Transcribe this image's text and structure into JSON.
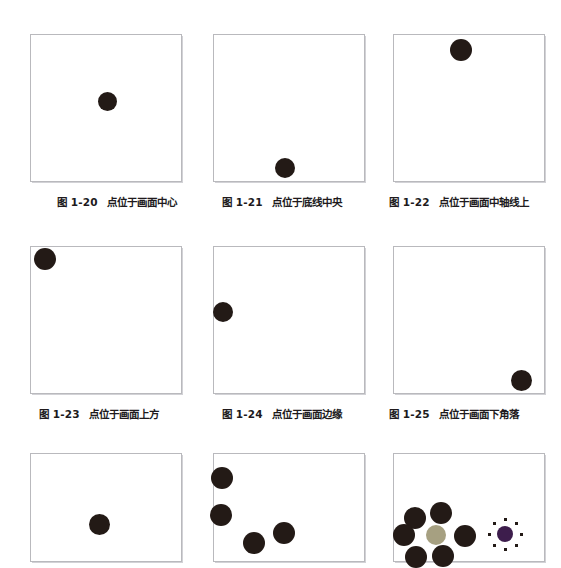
{
  "page": {
    "background_color": "#ffffff",
    "frame_border_color": "#b9b9bd",
    "dot_color": "#231a16",
    "accent_tan_color": "#a6a081",
    "accent_purple_color": "#3d1d4c"
  },
  "figures": [
    {
      "id": "fig-1-20",
      "label": "图 1-20",
      "caption": "点位于画面中心",
      "frame": {
        "x": 30,
        "y": 34,
        "w": 152,
        "h": 148
      },
      "dots": [
        {
          "cx": 107,
          "cy": 101,
          "r": 9.5,
          "color": "#231a16",
          "name": "dot-center"
        }
      ]
    },
    {
      "id": "fig-1-21",
      "label": "图 1-21",
      "caption": "点位于底线中央",
      "frame": {
        "x": 213,
        "y": 34,
        "w": 152,
        "h": 148
      },
      "dots": [
        {
          "cx": 285,
          "cy": 168,
          "r": 10,
          "color": "#231a16",
          "name": "dot-bottom-center"
        }
      ]
    },
    {
      "id": "fig-1-22",
      "label": "图 1-22",
      "caption": "点位于画面中轴线上",
      "frame": {
        "x": 393,
        "y": 34,
        "w": 152,
        "h": 148
      },
      "dots": [
        {
          "cx": 461,
          "cy": 50,
          "r": 11,
          "color": "#231a16",
          "name": "dot-top-axis"
        }
      ]
    },
    {
      "id": "fig-1-23",
      "label": "图 1-23",
      "caption": "点位于画面上方",
      "frame": {
        "x": 30,
        "y": 246,
        "w": 152,
        "h": 148
      },
      "dots": [
        {
          "cx": 45,
          "cy": 259,
          "r": 11,
          "color": "#231a16",
          "name": "dot-top-left"
        }
      ]
    },
    {
      "id": "fig-1-24",
      "label": "图 1-24",
      "caption": "点位于画面边缘",
      "frame": {
        "x": 213,
        "y": 246,
        "w": 152,
        "h": 148
      },
      "dots": [
        {
          "cx": 223,
          "cy": 312,
          "r": 10,
          "color": "#231a16",
          "name": "dot-left-edge"
        }
      ]
    },
    {
      "id": "fig-1-25",
      "label": "图 1-25",
      "caption": "点位于画面下角落",
      "frame": {
        "x": 393,
        "y": 246,
        "w": 152,
        "h": 148
      },
      "dots": [
        {
          "cx": 521,
          "cy": 380,
          "r": 10.5,
          "color": "#231a16",
          "name": "dot-bottom-right-corner"
        }
      ]
    },
    {
      "id": "fig-row3-left",
      "label": "",
      "caption": "",
      "frame": {
        "x": 30,
        "y": 453,
        "w": 152,
        "h": 109
      },
      "dots": [
        {
          "cx": 99,
          "cy": 524,
          "r": 10.5,
          "color": "#231a16",
          "name": "dot-center-lower"
        }
      ]
    },
    {
      "id": "fig-row3-middle",
      "label": "",
      "caption": "",
      "frame": {
        "x": 213,
        "y": 453,
        "w": 152,
        "h": 109
      },
      "dots": [
        {
          "cx": 222,
          "cy": 478,
          "r": 11,
          "color": "#231a16",
          "name": "dot-cluster-1"
        },
        {
          "cx": 221,
          "cy": 515,
          "r": 11,
          "color": "#231a16",
          "name": "dot-cluster-2"
        },
        {
          "cx": 254,
          "cy": 543,
          "r": 11,
          "color": "#231a16",
          "name": "dot-cluster-3"
        },
        {
          "cx": 284,
          "cy": 533,
          "r": 11,
          "color": "#231a16",
          "name": "dot-cluster-4"
        }
      ]
    },
    {
      "id": "fig-row3-right",
      "label": "",
      "caption": "",
      "frame": {
        "x": 393,
        "y": 453,
        "w": 152,
        "h": 109
      },
      "dots": [
        {
          "cx": 415,
          "cy": 518,
          "r": 11,
          "color": "#231a16",
          "name": "rosette-dot-upper-left"
        },
        {
          "cx": 441,
          "cy": 513,
          "r": 11,
          "color": "#231a16",
          "name": "rosette-dot-upper-right"
        },
        {
          "cx": 404,
          "cy": 535,
          "r": 11,
          "color": "#231a16",
          "name": "rosette-dot-left"
        },
        {
          "cx": 465,
          "cy": 536,
          "r": 11,
          "color": "#231a16",
          "name": "rosette-dot-right"
        },
        {
          "cx": 416,
          "cy": 557,
          "r": 11,
          "color": "#231a16",
          "name": "rosette-dot-lower-left"
        },
        {
          "cx": 443,
          "cy": 556,
          "r": 11,
          "color": "#231a16",
          "name": "rosette-dot-lower-right"
        },
        {
          "cx": 436,
          "cy": 535,
          "r": 10,
          "color": "#a6a081",
          "name": "rosette-center-dot-tan"
        },
        {
          "cx": 505,
          "cy": 534,
          "r": 8,
          "color": "#3d1d4c",
          "name": "accent-dot-purple"
        }
      ],
      "sparks": [
        {
          "cx": 505,
          "cy": 519,
          "name": "spark-n"
        },
        {
          "cx": 516,
          "cy": 523,
          "name": "spark-ne"
        },
        {
          "cx": 521,
          "cy": 534,
          "name": "spark-e"
        },
        {
          "cx": 516,
          "cy": 545,
          "name": "spark-se"
        },
        {
          "cx": 505,
          "cy": 549,
          "name": "spark-s"
        },
        {
          "cx": 494,
          "cy": 545,
          "name": "spark-sw"
        },
        {
          "cx": 489,
          "cy": 534,
          "name": "spark-w"
        },
        {
          "cx": 494,
          "cy": 523,
          "name": "spark-nw"
        }
      ]
    }
  ],
  "captions": [
    {
      "id": "cap-1-20",
      "label": "图 1-20",
      "text": "点位于画面中心",
      "x": 57,
      "y": 194
    },
    {
      "id": "cap-1-21",
      "label": "图 1-21",
      "text": "点位于底线中央",
      "x": 222,
      "y": 194
    },
    {
      "id": "cap-1-22",
      "label": "图 1-22",
      "text": "点位于画面中轴线上",
      "x": 389,
      "y": 194
    },
    {
      "id": "cap-1-23",
      "label": "图 1-23",
      "text": "点位于画面上方",
      "x": 39,
      "y": 406
    },
    {
      "id": "cap-1-24",
      "label": "图 1-24",
      "text": "点位于画面边缘",
      "x": 222,
      "y": 406
    },
    {
      "id": "cap-1-25",
      "label": "图 1-25",
      "text": "点位于画面下角落",
      "x": 389,
      "y": 406
    }
  ]
}
